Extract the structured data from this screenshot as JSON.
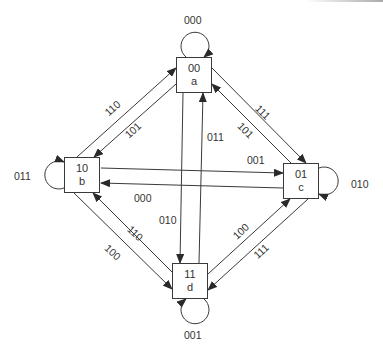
{
  "diagram": {
    "type": "state-transition-diagram",
    "states": [
      {
        "id": "a",
        "code": "00",
        "name": "a"
      },
      {
        "id": "b",
        "code": "10",
        "name": "b"
      },
      {
        "id": "c",
        "code": "01",
        "name": "c"
      },
      {
        "id": "d",
        "code": "11",
        "name": "d"
      }
    ],
    "self_loops": {
      "a": "000",
      "b": "011",
      "c": "010",
      "d": "001"
    },
    "transitions": {
      "b_to_a": "110",
      "a_to_b": "101",
      "a_to_c": "111",
      "c_to_a": "101",
      "b_to_c": "001",
      "c_to_b": "000",
      "a_to_d": "010",
      "d_to_a": "011",
      "b_to_d": "100",
      "d_to_b": "110",
      "d_to_c": "100",
      "c_to_d": "111"
    },
    "line_color": "#3a3a3a"
  }
}
